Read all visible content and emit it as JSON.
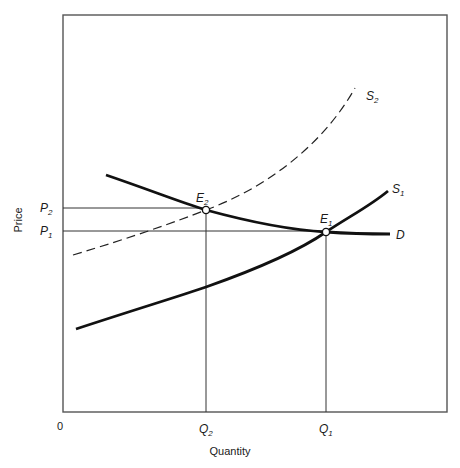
{
  "diagram": {
    "type": "supply-demand",
    "axes": {
      "x_label": "Quantity",
      "y_label": "Price",
      "origin_label": "0"
    },
    "price_ticks": [
      {
        "name": "P",
        "sub": "2",
        "y": 208
      },
      {
        "name": "P",
        "sub": "1",
        "y": 231
      }
    ],
    "quantity_ticks": [
      {
        "name": "Q",
        "sub": "2",
        "x": 206
      },
      {
        "name": "Q",
        "sub": "1",
        "x": 326
      }
    ],
    "curves": {
      "s2": {
        "name": "S",
        "sub": "2",
        "style": "dashed"
      },
      "s1": {
        "name": "S",
        "sub": "1",
        "style": "solid"
      },
      "d": {
        "name": "D",
        "style": "solid"
      }
    },
    "equilibria": [
      {
        "name": "E",
        "sub": "2",
        "x": 206,
        "y": 210
      },
      {
        "name": "E",
        "sub": "1",
        "x": 326,
        "y": 232
      }
    ],
    "colors": {
      "line": "#1a1a1a",
      "frame": "#555555",
      "background": "#ffffff"
    }
  }
}
